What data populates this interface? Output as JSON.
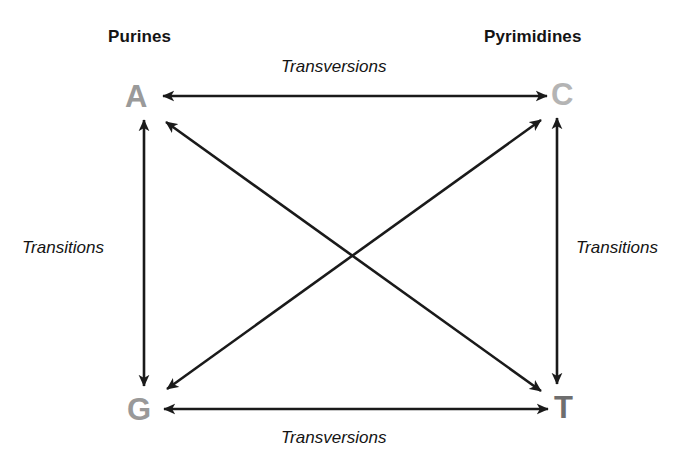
{
  "diagram": {
    "background_color": "#ffffff",
    "line_color": "#1a1a1a",
    "group_labels": {
      "left": "Purines",
      "right": "Pyrimidines"
    },
    "bases": [
      {
        "id": "A",
        "label": "A",
        "name": "adenine",
        "group": "purine",
        "color": "#9a9a9a",
        "x": 140,
        "y": 96
      },
      {
        "id": "C",
        "label": "C",
        "name": "cytosine",
        "group": "pyrimidine",
        "color": "#b4b4b4",
        "x": 565,
        "y": 94
      },
      {
        "id": "G",
        "label": "G",
        "name": "guanine",
        "group": "purine",
        "color": "#999999",
        "x": 141,
        "y": 409
      },
      {
        "id": "T",
        "label": "T",
        "name": "thymine",
        "group": "pyrimidine",
        "color": "#6e6e6e",
        "x": 567,
        "y": 407
      }
    ],
    "edges": [
      {
        "id": "A-C",
        "from": "A",
        "to": "C",
        "type": "Transversions",
        "orientation": "horizontal-top",
        "double_headed": true
      },
      {
        "id": "G-T",
        "from": "G",
        "to": "T",
        "type": "Transversions",
        "orientation": "horizontal-bottom",
        "double_headed": true
      },
      {
        "id": "A-G",
        "from": "A",
        "to": "G",
        "type": "Transitions",
        "orientation": "vertical-left",
        "double_headed": true
      },
      {
        "id": "C-T",
        "from": "C",
        "to": "T",
        "type": "Transitions",
        "orientation": "vertical-right",
        "double_headed": true
      },
      {
        "id": "A-T",
        "from": "A",
        "to": "T",
        "type": "Transversions",
        "orientation": "diagonal",
        "double_headed": true
      },
      {
        "id": "G-C",
        "from": "G",
        "to": "C",
        "type": "Transversions",
        "orientation": "diagonal",
        "double_headed": true
      }
    ],
    "edge_labels": {
      "transversions_top": "Transversions",
      "transversions_bottom": "Transversions",
      "transitions_left": "Transitions",
      "transitions_right": "Transitions"
    }
  }
}
